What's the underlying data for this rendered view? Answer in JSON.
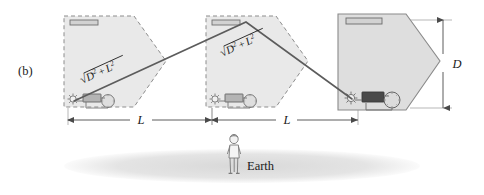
{
  "figure": {
    "panel_label": "(b)",
    "earth_label": "Earth",
    "dimension_horizontal_1": "L",
    "dimension_horizontal_2": "L",
    "dimension_vertical": "D",
    "hypotenuse_label_1": {
      "radical": "√",
      "base1": "D",
      "sup1": "2",
      "operator": "+",
      "base2": "L",
      "sup2": "2"
    },
    "hypotenuse_label_2": {
      "radical": "√",
      "base1": "D",
      "sup1": "2",
      "operator": "+",
      "base2": "L",
      "sup2": "2"
    },
    "colors": {
      "stroke": "#5a5a5a",
      "ship_fill": "#e6e6e6",
      "ship_fill_solid": "#dcdcdc",
      "mirror_fill": "#d0d0d0",
      "detector_fill": "#4a4a4a",
      "clock_fill": "#dddddd",
      "earth_fill": "#e2e2e2",
      "text": "#1a1a1a",
      "ray": "#606060"
    },
    "ships": [
      {
        "name": "spaceship-left-ghost",
        "style": "dashed",
        "label": "ghost position 1",
        "parts": [
          "mirror",
          "light-source",
          "detector",
          "clock"
        ]
      },
      {
        "name": "spaceship-middle-ghost",
        "style": "dashed",
        "label": "ghost position 2",
        "parts": [
          "mirror",
          "light-source",
          "detector",
          "clock"
        ]
      },
      {
        "name": "spaceship-right-solid",
        "style": "solid",
        "label": "final position",
        "parts": [
          "mirror",
          "light-source",
          "detector",
          "clock"
        ]
      }
    ],
    "observer": {
      "name": "earth-observer",
      "description": "standing person"
    },
    "light_path": {
      "description": "zig-zag light beam from emitter up to mirror and back down to detector",
      "vertices": [
        [
          74,
          102
        ],
        [
          246,
          22
        ],
        [
          352,
          100
        ]
      ]
    }
  }
}
